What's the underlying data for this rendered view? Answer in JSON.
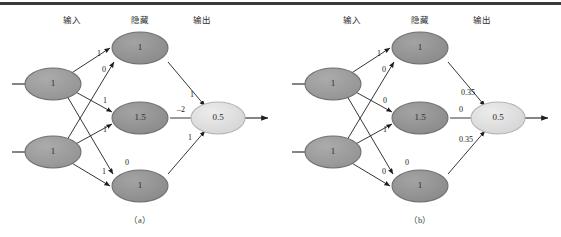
{
  "figure": {
    "top_rule_color": "#3a3a3a",
    "background": "#ffffff",
    "column_headers": [
      "输入",
      "隐藏",
      "输出"
    ],
    "captions": [
      "（a）",
      "（b）"
    ],
    "colors": {
      "input_node_fill": "#9a9a9a",
      "hidden_node_fill": "#8f8f8f",
      "output_node_fill": "#dcdcdc",
      "node_stroke": "#6f6f6f",
      "edge_stroke": "#1f1f1f",
      "text": "#2b2b2b"
    }
  },
  "panels": [
    {
      "id": "a",
      "caption": "（a）",
      "headers": {
        "input": "输入",
        "hidden": "隐藏",
        "output": "输出"
      },
      "input_nodes": [
        {
          "name": "input-node-top",
          "value": "1"
        },
        {
          "name": "input-node-bottom",
          "value": "1"
        }
      ],
      "hidden_nodes": [
        {
          "name": "hidden-node-top",
          "value": "1"
        },
        {
          "name": "hidden-node-middle",
          "value": "1.5"
        },
        {
          "name": "hidden-node-bottom",
          "value": "1"
        }
      ],
      "output_nodes": [
        {
          "name": "output-node",
          "value": "0.5"
        }
      ],
      "input_hidden_weights": [
        {
          "from": "input-top",
          "to": "hidden-top",
          "label": "1"
        },
        {
          "from": "input-top",
          "to": "hidden-middle",
          "label": "1"
        },
        {
          "from": "input-top",
          "to": "hidden-bottom",
          "label": "1"
        },
        {
          "from": "input-bottom",
          "to": "hidden-top",
          "label": "0"
        },
        {
          "from": "input-bottom",
          "to": "hidden-middle",
          "label": "1"
        },
        {
          "from": "input-bottom",
          "to": "hidden-bottom",
          "label": "0"
        }
      ],
      "hidden_output_weights": [
        {
          "from": "hidden-top",
          "to": "output",
          "label": "1"
        },
        {
          "from": "hidden-middle",
          "to": "output",
          "label": "–2"
        },
        {
          "from": "hidden-bottom",
          "to": "output",
          "label": "1"
        }
      ]
    },
    {
      "id": "b",
      "caption": "（b）",
      "headers": {
        "input": "输入",
        "hidden": "隐藏",
        "output": "输出"
      },
      "input_nodes": [
        {
          "name": "input-node-top",
          "value": "1"
        },
        {
          "name": "input-node-bottom",
          "value": "1"
        }
      ],
      "hidden_nodes": [
        {
          "name": "hidden-node-top",
          "value": "1"
        },
        {
          "name": "hidden-node-middle",
          "value": "1.5"
        },
        {
          "name": "hidden-node-bottom",
          "value": "1"
        }
      ],
      "output_nodes": [
        {
          "name": "output-node",
          "value": "0.5"
        }
      ],
      "input_hidden_weights": [
        {
          "from": "input-top",
          "to": "hidden-top",
          "label": "1"
        },
        {
          "from": "input-top",
          "to": "hidden-middle",
          "label": "0"
        },
        {
          "from": "input-top",
          "to": "hidden-bottom",
          "label": "1"
        },
        {
          "from": "input-bottom",
          "to": "hidden-top",
          "label": "0"
        },
        {
          "from": "input-bottom",
          "to": "hidden-middle",
          "label": "0"
        },
        {
          "from": "input-bottom",
          "to": "hidden-bottom",
          "label": "0"
        }
      ],
      "hidden_output_weights": [
        {
          "from": "hidden-top",
          "to": "output",
          "label": "0.35"
        },
        {
          "from": "hidden-middle",
          "to": "output",
          "label": "0"
        },
        {
          "from": "hidden-bottom",
          "to": "output",
          "label": "0.35"
        }
      ]
    }
  ]
}
